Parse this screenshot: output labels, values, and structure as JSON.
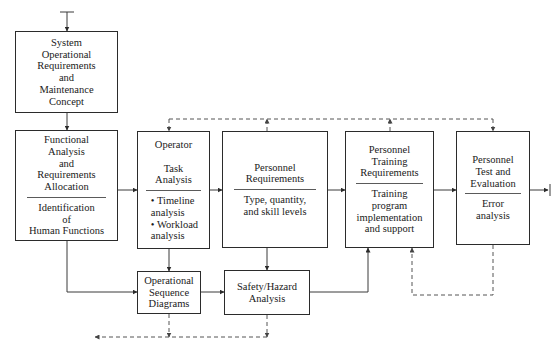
{
  "diagram": {
    "canvas": {
      "width": 558,
      "height": 352
    },
    "colors": {
      "box_border": "#2b2b2b",
      "line": "#3a3a3a",
      "dashed_line": "#555555",
      "background": "#ffffff",
      "text": "#1a1a1a"
    }
  },
  "nodes": {
    "system_operational": {
      "title": "System\nOperational\nRequirements\nand\nMaintenance\nConcept"
    },
    "functional_analysis": {
      "title": "Functional\nAnalysis\nand\nRequirements\nAllocation",
      "sub": "Identification\nof\nHuman Functions"
    },
    "operator_task": {
      "title": "Operator\n\nTask\nAnalysis",
      "bullets": "• Timeline\n   analysis\n• Workload\n   analysis"
    },
    "personnel_requirements": {
      "title": "Personnel\nRequirements",
      "sub": "Type, quantity,\nand skill levels"
    },
    "personnel_training": {
      "title": "Personnel\nTraining\nRequirements",
      "sub": "Training\nprogram\nimplementation\nand support"
    },
    "personnel_test": {
      "title": "Personnel\nTest and\nEvaluation",
      "sub": "Error\nanalysis"
    },
    "operational_sequence": {
      "title": "Operational\nSequence\nDiagrams"
    },
    "safety_hazard": {
      "title": "Safety/Hazard\nAnalysis"
    }
  },
  "edges": [
    {
      "name": "input-to-system-operational",
      "style": "solid"
    },
    {
      "name": "system-operational-to-functional-analysis",
      "style": "solid"
    },
    {
      "name": "functional-analysis-to-operator-task",
      "style": "solid"
    },
    {
      "name": "functional-analysis-to-operational-sequence",
      "style": "solid"
    },
    {
      "name": "operator-task-to-personnel-requirements",
      "style": "solid"
    },
    {
      "name": "operator-task-to-operational-sequence",
      "style": "solid"
    },
    {
      "name": "personnel-requirements-to-personnel-training",
      "style": "solid"
    },
    {
      "name": "personnel-requirements-to-safety-hazard",
      "style": "solid"
    },
    {
      "name": "personnel-training-to-personnel-test",
      "style": "solid"
    },
    {
      "name": "operational-sequence-to-safety-hazard",
      "style": "solid"
    },
    {
      "name": "safety-hazard-to-personnel-training",
      "style": "solid"
    },
    {
      "name": "personnel-test-output",
      "style": "solid"
    },
    {
      "name": "feedback-top-bus",
      "style": "dashed"
    },
    {
      "name": "feedback-personnel-test-to-personnel-training",
      "style": "dashed"
    },
    {
      "name": "feedback-bottom-bus",
      "style": "dashed"
    }
  ]
}
